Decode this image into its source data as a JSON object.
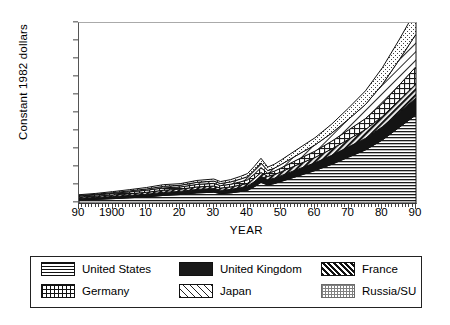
{
  "chart_data": {
    "type": "area",
    "title": "",
    "xlabel": "YEAR",
    "ylabel": "Constant 1982 dollars",
    "xlim": [
      1890,
      1990
    ],
    "ylim": [
      0,
      10000
    ],
    "grid": false,
    "stacked": true,
    "legend_position": "bottom",
    "y_ticks": [
      0,
      1000,
      2000,
      3000,
      4000,
      5000,
      6000,
      7000,
      8000,
      9000,
      10000
    ],
    "y_tick_labels": [
      "0",
      "1000",
      "2000",
      "3000",
      "4000",
      "5000",
      "6000",
      "7000",
      "8000",
      "9000",
      "10000"
    ],
    "x_ticks": [
      1890,
      1900,
      1910,
      1920,
      1930,
      1940,
      1950,
      1960,
      1970,
      1980,
      1990
    ],
    "x_tick_labels": [
      "90",
      "1900",
      "10",
      "20",
      "30",
      "40",
      "50",
      "60",
      "70",
      "80",
      "90"
    ],
    "x": [
      1890,
      1895,
      1900,
      1905,
      1910,
      1915,
      1920,
      1925,
      1930,
      1932,
      1935,
      1938,
      1940,
      1942,
      1944,
      1946,
      1948,
      1950,
      1955,
      1960,
      1965,
      1970,
      1975,
      1980,
      1985,
      1990
    ],
    "series": [
      {
        "name": "United States",
        "pattern": "horizontal-lines",
        "values": [
          170,
          200,
          240,
          290,
          340,
          420,
          470,
          560,
          600,
          520,
          560,
          640,
          700,
          900,
          1150,
          1000,
          1080,
          1200,
          1500,
          1800,
          2150,
          2550,
          2950,
          3500,
          4200,
          4900
        ]
      },
      {
        "name": "United Kingdom",
        "pattern": "solid-black",
        "values": [
          95,
          105,
          120,
          130,
          145,
          170,
          175,
          195,
          200,
          180,
          195,
          215,
          235,
          280,
          330,
          290,
          300,
          320,
          380,
          430,
          500,
          570,
          640,
          730,
          830,
          930
        ]
      },
      {
        "name": "France",
        "pattern": "dense-diagonal",
        "values": [
          70,
          78,
          88,
          98,
          108,
          118,
          125,
          138,
          142,
          130,
          138,
          150,
          160,
          185,
          215,
          190,
          200,
          215,
          260,
          300,
          355,
          420,
          490,
          580,
          680,
          790
        ]
      },
      {
        "name": "Germany",
        "pattern": "cross-hatch",
        "values": [
          60,
          70,
          85,
          100,
          115,
          130,
          120,
          140,
          150,
          135,
          150,
          175,
          195,
          235,
          275,
          170,
          190,
          215,
          285,
          350,
          430,
          520,
          610,
          720,
          840,
          960
        ]
      },
      {
        "name": "Japan",
        "pattern": "light-diagonal",
        "values": [
          25,
          32,
          42,
          55,
          70,
          85,
          95,
          115,
          125,
          115,
          130,
          155,
          175,
          215,
          255,
          150,
          170,
          195,
          265,
          340,
          450,
          600,
          780,
          1050,
          1400,
          1800
        ]
      },
      {
        "name": "Russia/SU",
        "pattern": "stipple",
        "values": [
          40,
          48,
          58,
          70,
          82,
          95,
          88,
          105,
          115,
          110,
          125,
          150,
          170,
          215,
          260,
          195,
          215,
          245,
          320,
          400,
          500,
          620,
          760,
          930,
          1120,
          1340
        ]
      }
    ]
  },
  "legend": {
    "items": [
      {
        "label": "United States",
        "swatch": "sw-us"
      },
      {
        "label": "United Kingdom",
        "swatch": "sw-uk"
      },
      {
        "label": "France",
        "swatch": "sw-fr"
      },
      {
        "label": "Germany",
        "swatch": "sw-de"
      },
      {
        "label": "Japan",
        "swatch": "sw-jp"
      },
      {
        "label": "Russia/SU",
        "swatch": "sw-ru"
      }
    ]
  }
}
